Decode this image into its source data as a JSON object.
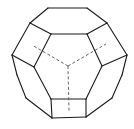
{
  "diagram": {
    "style": "line drawing",
    "colors": {
      "edge": "#1a1a1a",
      "hidden_edge": "#555555",
      "background": "#ffffff"
    },
    "visible_edges": [
      [
        48,
        8,
        87,
        8
      ],
      [
        48,
        8,
        30,
        23
      ],
      [
        87,
        8,
        107,
        23
      ],
      [
        30,
        23,
        51,
        34
      ],
      [
        107,
        23,
        87,
        34
      ],
      [
        51,
        34,
        87,
        34
      ],
      [
        30,
        23,
        12,
        55
      ],
      [
        107,
        23,
        127,
        55
      ],
      [
        51,
        34,
        34,
        67
      ],
      [
        87,
        34,
        102,
        66
      ],
      [
        12,
        55,
        34,
        67
      ],
      [
        127,
        55,
        102,
        66
      ],
      [
        12,
        55,
        17,
        75
      ],
      [
        17,
        75,
        26,
        98
      ],
      [
        127,
        55,
        122,
        75
      ],
      [
        122,
        75,
        112,
        98
      ],
      [
        34,
        67,
        51,
        99
      ],
      [
        102,
        66,
        86,
        99
      ],
      [
        26,
        98,
        52,
        118
      ],
      [
        112,
        98,
        86,
        117
      ],
      [
        51,
        99,
        86,
        99
      ],
      [
        51,
        99,
        52,
        118
      ],
      [
        86,
        99,
        86,
        117
      ],
      [
        52,
        118,
        86,
        117
      ]
    ],
    "hidden_edges": [
      [
        68,
        66,
        32,
        45
      ],
      [
        68,
        66,
        106,
        44
      ],
      [
        68,
        66,
        69,
        111
      ]
    ]
  }
}
